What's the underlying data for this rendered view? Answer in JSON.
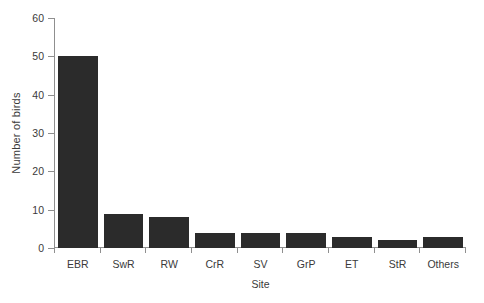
{
  "chart_data": {
    "type": "bar",
    "title": "",
    "subtitle": "",
    "xlabel": "Site",
    "ylabel": "Number of birds",
    "categories": [
      "EBR",
      "SwR",
      "RW",
      "CrR",
      "SV",
      "GrP",
      "ET",
      "StR",
      "Others"
    ],
    "values": [
      50,
      9,
      8,
      4,
      4,
      4,
      3,
      2,
      3
    ],
    "series": [
      {
        "name": "Number of birds",
        "values": [
          50,
          9,
          8,
          4,
          4,
          4,
          3,
          2,
          3
        ]
      }
    ],
    "ylim": [
      0,
      60
    ],
    "yticks": [
      0,
      10,
      20,
      30,
      40,
      50,
      60
    ],
    "ytick_labels": [
      "0",
      "10",
      "20",
      "30",
      "40",
      "50",
      "60"
    ],
    "grid": false,
    "legend": "none",
    "bar_color": "#2b2b2b",
    "axis_color": "#8f8f8f",
    "background": "#ffffff"
  }
}
